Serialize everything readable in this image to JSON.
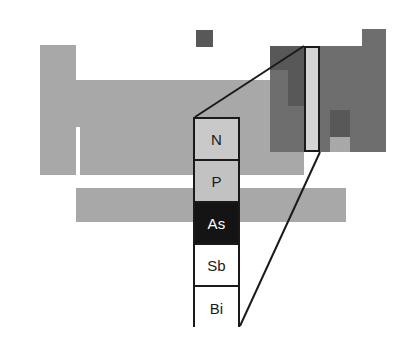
{
  "figure": {
    "name": "periodic-table-group-15-callout",
    "background_color": "#ffffff",
    "width": 416,
    "height": 360
  },
  "colors": {
    "outline": "#1a1a1a",
    "metal_gray": "#a8a8a8",
    "nonmetal_dark_gray": "#6e6e6e",
    "darker_gray": "#585858",
    "highlight_light": "#d4d4d4",
    "cell_light_gray": "#c9c9c9",
    "cell_mid_gray": "#c2c2c2",
    "cell_black": "#141414",
    "cell_white": "#ffffff",
    "text_dark": "#1a1a1a",
    "text_light": "#ffffff"
  },
  "callout": {
    "label": "Group 15 pnictogens column",
    "box": {
      "x": 193,
      "y": 117,
      "width": 47,
      "height": 210
    },
    "cells": [
      {
        "symbol": "N",
        "name": "nitrogen",
        "fill": "#c9c9c9",
        "text_color": "#1a1a1a"
      },
      {
        "symbol": "P",
        "name": "phosphorus",
        "fill": "#c2c2c2",
        "text_color": "#1a1a1a"
      },
      {
        "symbol": "As",
        "name": "arsenic",
        "fill": "#141414",
        "text_color": "#ffffff"
      },
      {
        "symbol": "Sb",
        "name": "antimony",
        "fill": "#ffffff",
        "text_color": "#1a1a1a"
      },
      {
        "symbol": "Bi",
        "name": "bismuth",
        "fill": "#ffffff",
        "text_color": "#1a1a1a"
      }
    ]
  },
  "mini_table": {
    "label": "miniature periodic table silhouette",
    "blocks": [
      {
        "name": "hydrogen-cell",
        "x": 196,
        "y": 30,
        "w": 17,
        "h": 17,
        "fill": "#585858"
      },
      {
        "name": "s-block-left-column",
        "x": 40,
        "y": 45,
        "w": 36,
        "h": 130,
        "fill": "#a8a8a8"
      },
      {
        "name": "d-block-main-body",
        "x": 40,
        "y": 80,
        "w": 230,
        "h": 95,
        "fill": "#a8a8a8"
      },
      {
        "name": "s-block-notch",
        "x": 76,
        "y": 127,
        "w": 4,
        "h": 48,
        "fill": "#ffffff"
      },
      {
        "name": "p-block-left-gray",
        "x": 270,
        "y": 80,
        "w": 34,
        "h": 95,
        "fill": "#a8a8a8"
      },
      {
        "name": "p-block-right-dark",
        "x": 270,
        "y": 46,
        "w": 116,
        "h": 106,
        "fill": "#6e6e6e"
      },
      {
        "name": "noble-gas-top-step",
        "x": 362,
        "y": 29,
        "w": 24,
        "h": 18,
        "fill": "#6e6e6e"
      },
      {
        "name": "nonmetal-patch-upper",
        "x": 270,
        "y": 46,
        "w": 18,
        "h": 24,
        "fill": "#585858"
      },
      {
        "name": "nonmetal-patch-mid",
        "x": 288,
        "y": 46,
        "w": 16,
        "h": 60,
        "fill": "#585858"
      },
      {
        "name": "metalloid-patch-low",
        "x": 330,
        "y": 110,
        "w": 20,
        "h": 27,
        "fill": "#585858"
      },
      {
        "name": "metalloid-patch-tail",
        "x": 330,
        "y": 137,
        "w": 20,
        "h": 15,
        "fill": "#a8a8a8"
      },
      {
        "name": "f-block-bottom-bar",
        "x": 76,
        "y": 188,
        "w": 270,
        "h": 34,
        "fill": "#a8a8a8"
      }
    ],
    "highlight_column": {
      "name": "group-15-highlight-column",
      "x": 304,
      "y": 46,
      "w": 16,
      "h": 106,
      "fill": "#d4d4d4",
      "stroke": "#1a1a1a"
    }
  },
  "connectors": [
    {
      "name": "connector-line-top",
      "x1": 304,
      "y1": 46,
      "x2": 195,
      "y2": 117
    },
    {
      "name": "connector-line-bottom",
      "x1": 320,
      "y1": 152,
      "x2": 240,
      "y2": 326
    }
  ]
}
